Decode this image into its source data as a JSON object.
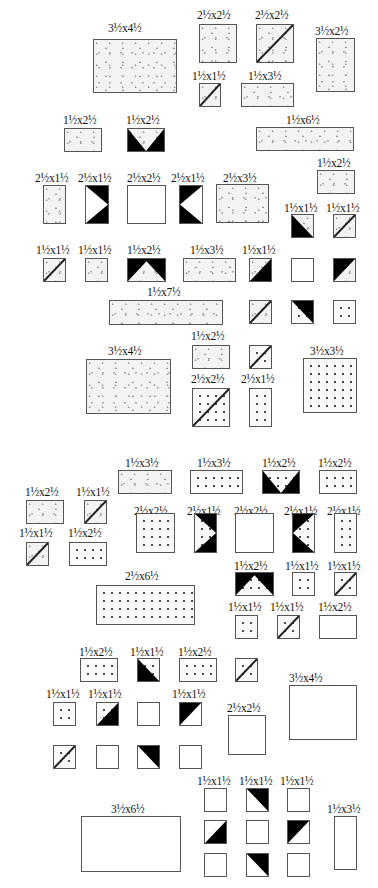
{
  "colors": {
    "outline": "#555555",
    "dark": "#000000",
    "light_fabric": "#f3f3f3"
  },
  "sections": [
    {
      "name": "upper",
      "pieces": [
        {
          "label": "3½x4½",
          "lx": 108,
          "ly": 22,
          "x": 93,
          "y": 39,
          "w": 84,
          "h": 54,
          "fill": "speckle",
          "overlay": ""
        },
        {
          "label": "2½x2½",
          "lx": 197,
          "ly": 9,
          "x": 199,
          "y": 24,
          "w": 38,
          "h": 39,
          "fill": "speckle",
          "overlay": ""
        },
        {
          "label": "2½x2½",
          "lx": 255,
          "ly": 9,
          "x": 256,
          "y": 24,
          "w": 38,
          "h": 39,
          "fill": "speckle",
          "overlay": "diag-bl-tr"
        },
        {
          "label": "3½x2½",
          "lx": 315,
          "ly": 25,
          "x": 316,
          "y": 38,
          "w": 39,
          "h": 54,
          "fill": "speckle",
          "overlay": ""
        },
        {
          "label": "1½x1½",
          "lx": 192,
          "ly": 70,
          "x": 199,
          "y": 83,
          "w": 22,
          "h": 24,
          "fill": "speckle",
          "overlay": "diag-bl-tr"
        },
        {
          "label": "1½x3½",
          "lx": 248,
          "ly": 70,
          "x": 241,
          "y": 83,
          "w": 53,
          "h": 24,
          "fill": "speckle",
          "overlay": ""
        },
        {
          "label": "1½x2½",
          "lx": 63,
          "ly": 114,
          "x": 64,
          "y": 128,
          "w": 38,
          "h": 24,
          "fill": "speckle",
          "overlay": ""
        },
        {
          "label": "1½x2½",
          "lx": 126,
          "ly": 114,
          "x": 127,
          "y": 128,
          "w": 38,
          "h": 24,
          "fill": "speckle",
          "overlay": "black-v-down"
        },
        {
          "label": "1½x6½",
          "lx": 286,
          "ly": 114,
          "x": 256,
          "y": 127,
          "w": 98,
          "h": 24,
          "fill": "speckle",
          "overlay": ""
        },
        {
          "label": "1½x2½",
          "lx": 317,
          "ly": 157,
          "x": 317,
          "y": 170,
          "w": 38,
          "h": 24,
          "fill": "speckle",
          "overlay": ""
        },
        {
          "label": "2½x1½",
          "lx": 35,
          "ly": 172,
          "x": 43,
          "y": 185,
          "w": 23,
          "h": 39,
          "fill": "speckle",
          "overlay": ""
        },
        {
          "label": "2½x1½",
          "lx": 78,
          "ly": 172,
          "x": 85,
          "y": 185,
          "w": 24,
          "h": 39,
          "fill": "plain",
          "overlay": "black-v-right"
        },
        {
          "label": "2½x2½",
          "lx": 127,
          "ly": 172,
          "x": 127,
          "y": 185,
          "w": 39,
          "h": 39,
          "fill": "plain",
          "overlay": ""
        },
        {
          "label": "2½x1½",
          "lx": 171,
          "ly": 172,
          "x": 179,
          "y": 185,
          "w": 24,
          "h": 39,
          "fill": "plain",
          "overlay": "black-v-left"
        },
        {
          "label": "2½x3½",
          "lx": 223,
          "ly": 172,
          "x": 216,
          "y": 184,
          "w": 53,
          "h": 39,
          "fill": "speckle",
          "overlay": ""
        },
        {
          "label": "1½x1½",
          "lx": 284,
          "ly": 202,
          "x": 291,
          "y": 214,
          "w": 23,
          "h": 24,
          "fill": "speckle",
          "overlay": "black-br-tl-left"
        },
        {
          "label": "1½x1½",
          "lx": 326,
          "ly": 202,
          "x": 333,
          "y": 214,
          "w": 23,
          "h": 24,
          "fill": "speckle",
          "overlay": "diag-bl-tr"
        },
        {
          "label": "1½x1½",
          "lx": 36,
          "ly": 244,
          "x": 43,
          "y": 258,
          "w": 23,
          "h": 24,
          "fill": "speckle",
          "overlay": "diag-bl-tr"
        },
        {
          "label": "1½x1½",
          "lx": 78,
          "ly": 244,
          "x": 85,
          "y": 258,
          "w": 23,
          "h": 24,
          "fill": "speckle",
          "overlay": ""
        },
        {
          "label": "1½x2½",
          "lx": 127,
          "ly": 244,
          "x": 127,
          "y": 258,
          "w": 39,
          "h": 24,
          "fill": "speckle",
          "overlay": "black-v-up"
        },
        {
          "label": "1½x3½",
          "lx": 190,
          "ly": 244,
          "x": 183,
          "y": 258,
          "w": 53,
          "h": 24,
          "fill": "speckle",
          "overlay": ""
        },
        {
          "label": "1½x1½",
          "lx": 242,
          "ly": 244,
          "x": 249,
          "y": 258,
          "w": 23,
          "h": 24,
          "fill": "speckle",
          "overlay": "black-br"
        },
        {
          "label": "",
          "lx": 0,
          "ly": 0,
          "x": 291,
          "y": 258,
          "w": 23,
          "h": 24,
          "fill": "plain",
          "overlay": ""
        },
        {
          "label": "",
          "lx": 0,
          "ly": 0,
          "x": 333,
          "y": 258,
          "w": 23,
          "h": 24,
          "fill": "speckle",
          "overlay": "black-tl"
        },
        {
          "label": "1½x7½",
          "lx": 147,
          "ly": 286,
          "x": 109,
          "y": 300,
          "w": 114,
          "h": 25,
          "fill": "speckle",
          "overlay": ""
        },
        {
          "label": "",
          "lx": 0,
          "ly": 0,
          "x": 249,
          "y": 300,
          "w": 23,
          "h": 24,
          "fill": "speckle",
          "overlay": "diag-bl-tr"
        },
        {
          "label": "",
          "lx": 0,
          "ly": 0,
          "x": 291,
          "y": 300,
          "w": 23,
          "h": 24,
          "fill": "dot",
          "overlay": "black-tr"
        },
        {
          "label": "",
          "lx": 0,
          "ly": 0,
          "x": 333,
          "y": 300,
          "w": 23,
          "h": 24,
          "fill": "dot",
          "overlay": ""
        },
        {
          "label": "1½x2½",
          "lx": 191,
          "ly": 330,
          "x": 192,
          "y": 345,
          "w": 38,
          "h": 24,
          "fill": "speckle",
          "overlay": ""
        },
        {
          "label": "",
          "lx": 0,
          "ly": 0,
          "x": 249,
          "y": 345,
          "w": 23,
          "h": 24,
          "fill": "dot",
          "overlay": "diag-bl-tr"
        },
        {
          "label": "3½x3½",
          "lx": 310,
          "ly": 345,
          "x": 303,
          "y": 358,
          "w": 54,
          "h": 55,
          "fill": "dot",
          "overlay": ""
        },
        {
          "label": "3½x4½",
          "lx": 108,
          "ly": 345,
          "x": 86,
          "y": 359,
          "w": 85,
          "h": 55,
          "fill": "speckle",
          "overlay": ""
        },
        {
          "label": "2½x2½",
          "lx": 191,
          "ly": 373,
          "x": 192,
          "y": 388,
          "w": 38,
          "h": 39,
          "fill": "dot",
          "overlay": "diag-bl-tr"
        },
        {
          "label": "2½x1½",
          "lx": 241,
          "ly": 373,
          "x": 249,
          "y": 388,
          "w": 23,
          "h": 39,
          "fill": "dot",
          "overlay": ""
        }
      ]
    },
    {
      "name": "lower",
      "pieces": [
        {
          "label": "1½x3½",
          "lx": 125,
          "ly": 457,
          "x": 118,
          "y": 470,
          "w": 54,
          "h": 24,
          "fill": "speckle",
          "overlay": ""
        },
        {
          "label": "1½x3½",
          "lx": 197,
          "ly": 457,
          "x": 190,
          "y": 470,
          "w": 53,
          "h": 24,
          "fill": "dot",
          "overlay": ""
        },
        {
          "label": "1½x2½",
          "lx": 262,
          "ly": 457,
          "x": 262,
          "y": 470,
          "w": 38,
          "h": 24,
          "fill": "dot",
          "overlay": "black-v-down"
        },
        {
          "label": "1½x2½",
          "lx": 318,
          "ly": 457,
          "x": 319,
          "y": 470,
          "w": 38,
          "h": 24,
          "fill": "dot",
          "overlay": ""
        },
        {
          "label": "1½x2½",
          "lx": 25,
          "ly": 486,
          "x": 26,
          "y": 500,
          "w": 38,
          "h": 24,
          "fill": "speckle",
          "overlay": ""
        },
        {
          "label": "1½x1½",
          "lx": 76,
          "ly": 486,
          "x": 84,
          "y": 500,
          "w": 23,
          "h": 24,
          "fill": "speckle",
          "overlay": "diag-bl-tr"
        },
        {
          "label": "2½x2½",
          "lx": 134,
          "ly": 505,
          "x": 136,
          "y": 513,
          "w": 39,
          "h": 40,
          "fill": "dot",
          "overlay": ""
        },
        {
          "label": "2½x1½",
          "lx": 187,
          "ly": 505,
          "x": 194,
          "y": 513,
          "w": 23,
          "h": 40,
          "fill": "dot",
          "overlay": "black-v-right"
        },
        {
          "label": "2½x2½",
          "lx": 234,
          "ly": 505,
          "x": 235,
          "y": 513,
          "w": 39,
          "h": 40,
          "fill": "plain",
          "overlay": ""
        },
        {
          "label": "2½x1½",
          "lx": 284,
          "ly": 505,
          "x": 292,
          "y": 513,
          "w": 23,
          "h": 40,
          "fill": "dot",
          "overlay": "black-v-left"
        },
        {
          "label": "2½x1½",
          "lx": 327,
          "ly": 505,
          "x": 334,
          "y": 513,
          "w": 23,
          "h": 40,
          "fill": "dot",
          "overlay": ""
        },
        {
          "label": "1½x1½",
          "lx": 19,
          "ly": 527,
          "x": 26,
          "y": 542,
          "w": 23,
          "h": 24,
          "fill": "speckle",
          "overlay": "diag-bl-tr"
        },
        {
          "label": "1½x2½",
          "lx": 68,
          "ly": 527,
          "x": 69,
          "y": 542,
          "w": 38,
          "h": 24,
          "fill": "dot",
          "overlay": ""
        },
        {
          "label": "1½x2½",
          "lx": 234,
          "ly": 560,
          "x": 235,
          "y": 572,
          "w": 39,
          "h": 24,
          "fill": "dot",
          "overlay": "black-v-up"
        },
        {
          "label": "1½x1½",
          "lx": 285,
          "ly": 560,
          "x": 292,
          "y": 572,
          "w": 23,
          "h": 24,
          "fill": "dot",
          "overlay": ""
        },
        {
          "label": "1½x1½",
          "lx": 327,
          "ly": 560,
          "x": 334,
          "y": 572,
          "w": 23,
          "h": 24,
          "fill": "dot",
          "overlay": "diag-bl-tr"
        },
        {
          "label": "2½x6½",
          "lx": 125,
          "ly": 570,
          "x": 96,
          "y": 585,
          "w": 99,
          "h": 40,
          "fill": "dot",
          "overlay": ""
        },
        {
          "label": "1½x1½",
          "lx": 228,
          "ly": 601,
          "x": 235,
          "y": 615,
          "w": 23,
          "h": 24,
          "fill": "dot",
          "overlay": ""
        },
        {
          "label": "1½x1½",
          "lx": 270,
          "ly": 601,
          "x": 277,
          "y": 615,
          "w": 23,
          "h": 24,
          "fill": "dot",
          "overlay": "diag-bl-tr"
        },
        {
          "label": "1½x2½",
          "lx": 318,
          "ly": 601,
          "x": 319,
          "y": 615,
          "w": 38,
          "h": 24,
          "fill": "plain",
          "overlay": ""
        },
        {
          "label": "1½x2½",
          "lx": 79,
          "ly": 646,
          "x": 80,
          "y": 658,
          "w": 38,
          "h": 24,
          "fill": "dot",
          "overlay": ""
        },
        {
          "label": "1½x1½",
          "lx": 130,
          "ly": 646,
          "x": 137,
          "y": 658,
          "w": 23,
          "h": 24,
          "fill": "dot",
          "overlay": "black-bl"
        },
        {
          "label": "1½x2½",
          "lx": 178,
          "ly": 646,
          "x": 179,
          "y": 658,
          "w": 38,
          "h": 24,
          "fill": "dot",
          "overlay": ""
        },
        {
          "label": "",
          "lx": 0,
          "ly": 0,
          "x": 235,
          "y": 658,
          "w": 23,
          "h": 24,
          "fill": "dot",
          "overlay": "diag-bl-tr"
        },
        {
          "label": "3½x4½",
          "lx": 289,
          "ly": 672,
          "x": 289,
          "y": 685,
          "w": 68,
          "h": 55,
          "fill": "plain",
          "overlay": ""
        },
        {
          "label": "1½x1½",
          "lx": 46,
          "ly": 688,
          "x": 53,
          "y": 702,
          "w": 23,
          "h": 24,
          "fill": "dot",
          "overlay": ""
        },
        {
          "label": "1½x1½",
          "lx": 88,
          "ly": 688,
          "x": 96,
          "y": 702,
          "w": 23,
          "h": 24,
          "fill": "dot",
          "overlay": "black-br"
        },
        {
          "label": "",
          "lx": 0,
          "ly": 0,
          "x": 137,
          "y": 702,
          "w": 23,
          "h": 24,
          "fill": "plain",
          "overlay": ""
        },
        {
          "label": "1½x1½",
          "lx": 172,
          "ly": 688,
          "x": 179,
          "y": 702,
          "w": 23,
          "h": 24,
          "fill": "plain",
          "overlay": "black-tl"
        },
        {
          "label": "2½x2½",
          "lx": 227,
          "ly": 702,
          "x": 228,
          "y": 715,
          "w": 38,
          "h": 40,
          "fill": "plain",
          "overlay": ""
        },
        {
          "label": "",
          "lx": 0,
          "ly": 0,
          "x": 53,
          "y": 745,
          "w": 23,
          "h": 24,
          "fill": "dot",
          "overlay": "diag-bl-tr"
        },
        {
          "label": "",
          "lx": 0,
          "ly": 0,
          "x": 96,
          "y": 745,
          "w": 23,
          "h": 24,
          "fill": "plain",
          "overlay": ""
        },
        {
          "label": "",
          "lx": 0,
          "ly": 0,
          "x": 137,
          "y": 745,
          "w": 23,
          "h": 24,
          "fill": "plain",
          "overlay": "black-tr"
        },
        {
          "label": "",
          "lx": 0,
          "ly": 0,
          "x": 179,
          "y": 745,
          "w": 23,
          "h": 24,
          "fill": "plain",
          "overlay": ""
        },
        {
          "label": "1½x1½",
          "lx": 197,
          "ly": 775,
          "x": 204,
          "y": 788,
          "w": 23,
          "h": 24,
          "fill": "plain",
          "overlay": ""
        },
        {
          "label": "1½x1½",
          "lx": 239,
          "ly": 775,
          "x": 246,
          "y": 788,
          "w": 23,
          "h": 24,
          "fill": "plain",
          "overlay": "black-tr"
        },
        {
          "label": "1½x1½",
          "lx": 280,
          "ly": 775,
          "x": 287,
          "y": 788,
          "w": 23,
          "h": 24,
          "fill": "plain",
          "overlay": ""
        },
        {
          "label": "1½x3½",
          "lx": 327,
          "ly": 803,
          "x": 334,
          "y": 816,
          "w": 23,
          "h": 54,
          "fill": "plain",
          "overlay": ""
        },
        {
          "label": "3½x6½",
          "lx": 111,
          "ly": 803,
          "x": 81,
          "y": 816,
          "w": 100,
          "h": 56,
          "fill": "plain",
          "overlay": ""
        },
        {
          "label": "",
          "lx": 0,
          "ly": 0,
          "x": 204,
          "y": 820,
          "w": 23,
          "h": 24,
          "fill": "plain",
          "overlay": "black-br"
        },
        {
          "label": "",
          "lx": 0,
          "ly": 0,
          "x": 246,
          "y": 820,
          "w": 23,
          "h": 24,
          "fill": "plain",
          "overlay": ""
        },
        {
          "label": "",
          "lx": 0,
          "ly": 0,
          "x": 287,
          "y": 820,
          "w": 23,
          "h": 24,
          "fill": "plain",
          "overlay": "black-tl"
        },
        {
          "label": "",
          "lx": 0,
          "ly": 0,
          "x": 204,
          "y": 853,
          "w": 23,
          "h": 24,
          "fill": "plain",
          "overlay": ""
        },
        {
          "label": "",
          "lx": 0,
          "ly": 0,
          "x": 246,
          "y": 853,
          "w": 23,
          "h": 24,
          "fill": "plain",
          "overlay": "black-tr"
        },
        {
          "label": "",
          "lx": 0,
          "ly": 0,
          "x": 287,
          "y": 853,
          "w": 23,
          "h": 24,
          "fill": "plain",
          "overlay": ""
        }
      ]
    }
  ]
}
